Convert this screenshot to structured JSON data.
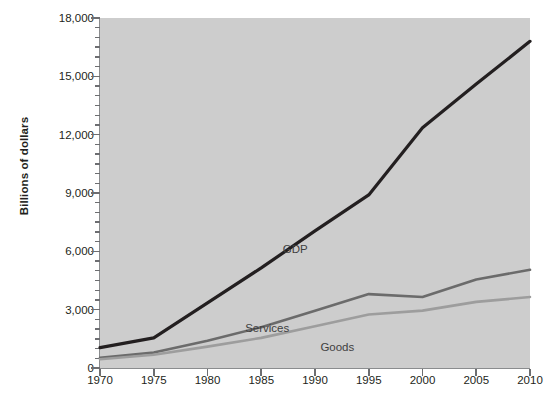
{
  "chart_data": {
    "type": "line",
    "title": "",
    "xlabel": "",
    "ylabel": "Billions of dollars",
    "x": [
      1970,
      1975,
      1980,
      1985,
      1990,
      1995,
      2000,
      2005,
      2010
    ],
    "xticklabels": [
      "1970",
      "1975",
      "1980",
      "1985",
      "1990",
      "1995",
      "2000",
      "2005",
      "2010"
    ],
    "xlim": [
      1970,
      2010
    ],
    "ylim": [
      0,
      18000
    ],
    "yticks": [
      0,
      3000,
      6000,
      9000,
      12000,
      15000,
      18000
    ],
    "yticklabels": [
      "0",
      "3,000",
      "6,000",
      "9,000",
      "12,000",
      "15,000",
      "18,000"
    ],
    "yminortick_interval": 500,
    "grid": false,
    "legend_position": "inline-annotations",
    "plot_background": "#cdcdcd",
    "figure_background": "#ffffff",
    "series": [
      {
        "name": "GDP",
        "color": "#231f20",
        "width": 3.2,
        "label_x": 1987,
        "label_y": 6450,
        "values": [
          1050,
          1550,
          3350,
          5150,
          7050,
          8900,
          12350,
          14600,
          16800
        ]
      },
      {
        "name": "Services",
        "color": "#6b6b6b",
        "width": 2.6,
        "label_x": 1983.5,
        "label_y": 2350,
        "values": [
          520,
          800,
          1400,
          2100,
          2950,
          3800,
          3650,
          4550,
          5050
        ]
      },
      {
        "name": "Goods",
        "color": "#9d9d9d",
        "width": 2.6,
        "label_x": 1990.5,
        "label_y": 1400,
        "values": [
          450,
          680,
          1100,
          1550,
          2150,
          2750,
          2950,
          3400,
          3650
        ]
      }
    ]
  },
  "axis_labels": {
    "y_title": "Billions of dollars"
  }
}
